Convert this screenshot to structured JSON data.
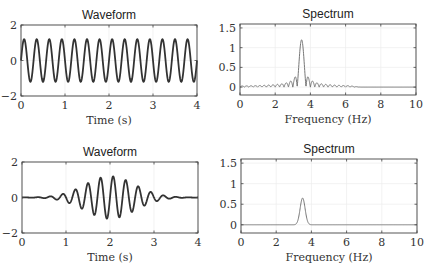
{
  "chart_data": [
    {
      "type": "line",
      "title": "Waveform",
      "xlabel": "Time (s)",
      "ylabel": "",
      "xlim": [
        0,
        4
      ],
      "ylim": [
        -2,
        2
      ],
      "xticks": [
        0,
        1,
        2,
        3,
        4
      ],
      "yticks": [
        -2,
        0,
        2
      ],
      "grid": true,
      "series": [
        {
          "name": "signal",
          "kind": "sine",
          "frequency_hz": 3.5,
          "amplitude": 1.2,
          "envelope": "none",
          "color": "#333333"
        }
      ],
      "box": {
        "x": 21,
        "y": 25,
        "w": 176,
        "h": 71
      }
    },
    {
      "type": "line",
      "title": "Spectrum",
      "xlabel": "Frequency (Hz)",
      "ylabel": "",
      "xlim": [
        0,
        10
      ],
      "ylim": [
        -0.2,
        1.6
      ],
      "xticks": [
        0,
        2,
        4,
        6,
        8,
        10
      ],
      "yticks": [
        0,
        0.5,
        1,
        1.5
      ],
      "grid": true,
      "series": [
        {
          "name": "magnitude",
          "kind": "sinc",
          "peak_hz": 3.5,
          "peak_value": 1.2,
          "color": "#777777"
        }
      ],
      "box": {
        "x": 240,
        "y": 24,
        "w": 176,
        "h": 71
      }
    },
    {
      "type": "line",
      "title": "Waveform",
      "xlabel": "Time (s)",
      "ylabel": "",
      "xlim": [
        0,
        4
      ],
      "ylim": [
        -2,
        2
      ],
      "xticks": [
        0,
        1,
        2,
        3,
        4
      ],
      "yticks": [
        -2,
        0,
        2
      ],
      "grid": true,
      "series": [
        {
          "name": "signal",
          "kind": "sine",
          "frequency_hz": 3.5,
          "amplitude": 1.2,
          "envelope": "gaussian",
          "center_s": 2,
          "width_s": 0.8,
          "color": "#333333"
        }
      ],
      "box": {
        "x": 22,
        "y": 162,
        "w": 176,
        "h": 71
      }
    },
    {
      "type": "line",
      "title": "Spectrum",
      "xlabel": "Frequency (Hz)",
      "ylabel": "",
      "xlim": [
        0,
        10
      ],
      "ylim": [
        -0.2,
        1.6
      ],
      "xticks": [
        0,
        2,
        4,
        6,
        8,
        10
      ],
      "yticks": [
        0,
        0.5,
        1,
        1.5
      ],
      "grid": true,
      "series": [
        {
          "name": "magnitude",
          "kind": "gaussian",
          "peak_hz": 3.5,
          "peak_value": 0.65,
          "width_hz": 0.2,
          "color": "#777777"
        }
      ],
      "box": {
        "x": 241,
        "y": 159,
        "w": 176,
        "h": 74
      }
    }
  ]
}
